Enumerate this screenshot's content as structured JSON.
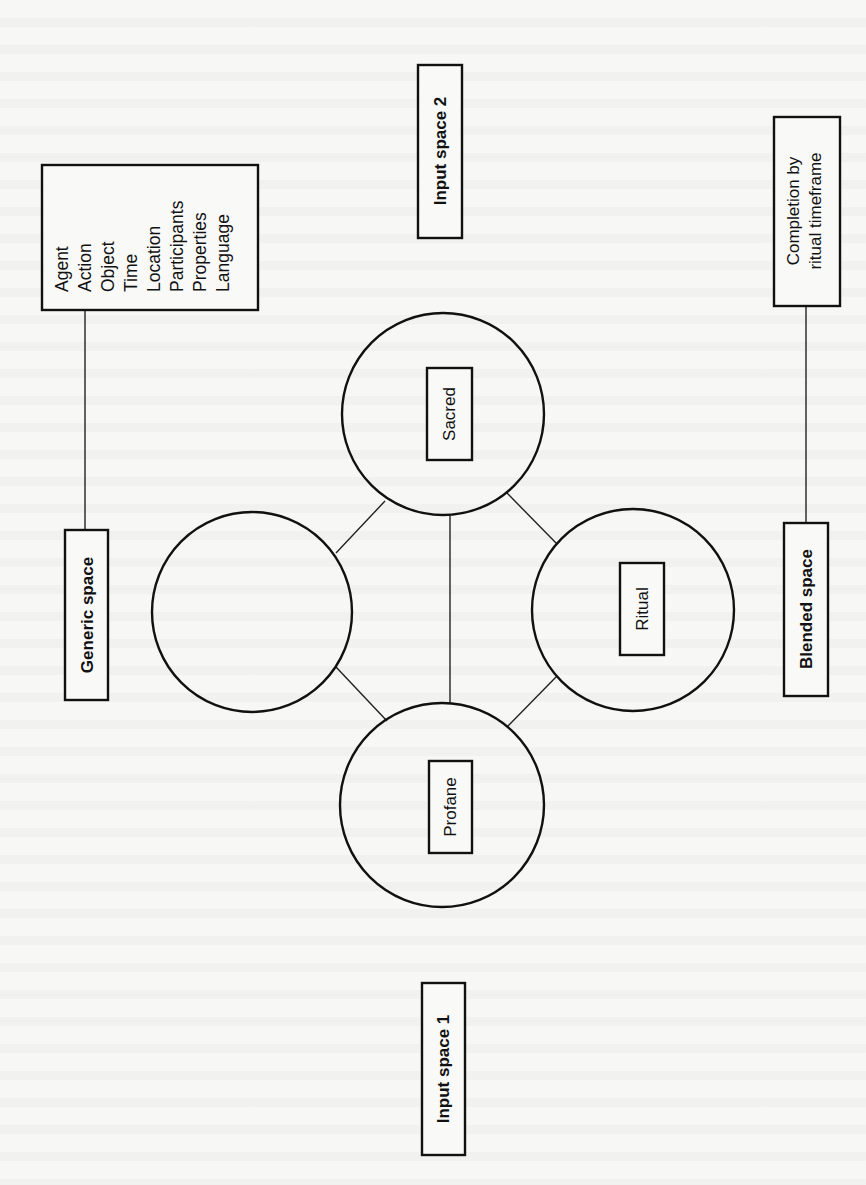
{
  "diagram": {
    "type": "conceptual-blending-network",
    "orientation": "rotated -90deg (text reads bottom to top)",
    "frame_elements_box": {
      "items": [
        "Agent",
        "Action",
        "Object",
        "Time",
        "Location",
        "Participants",
        "Properties",
        "Language"
      ]
    },
    "generic_space": {
      "label": "Generic space"
    },
    "input_space_1": {
      "label": "Input space 1"
    },
    "input_space_2": {
      "label": "Input space 2"
    },
    "blended_space": {
      "label": "Blended space"
    },
    "emergent_structure": {
      "line1": "Completion by",
      "line2": "ritual timeframe"
    },
    "circles": {
      "generic": {
        "label": ""
      },
      "sacred": {
        "label": "Sacred"
      },
      "ritual": {
        "label": "Ritual"
      },
      "profane": {
        "label": "Profane"
      }
    },
    "colors": {
      "background": "#f7f7f6",
      "stroke": "#111111"
    }
  }
}
